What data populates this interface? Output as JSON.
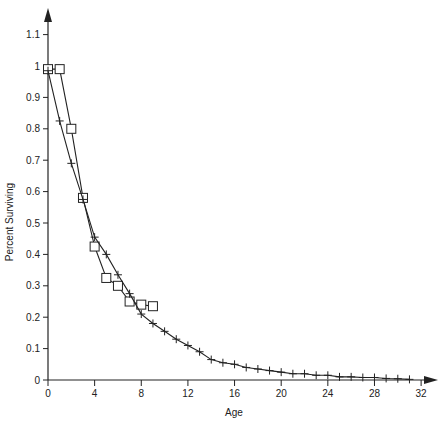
{
  "chart_data": {
    "type": "line",
    "title": "",
    "xlabel": "Age",
    "ylabel": "Percent Surviving",
    "xlim": [
      0,
      33
    ],
    "ylim": [
      0,
      1.15
    ],
    "grid": false,
    "legend": null,
    "x_ticks": [
      0,
      4,
      8,
      12,
      16,
      20,
      24,
      28,
      32
    ],
    "x_tick_labels": [
      "0",
      "4",
      "8",
      "12",
      "16",
      "20",
      "24",
      "28",
      "32"
    ],
    "y_ticks": [
      0,
      0.1,
      0.2,
      0.3,
      0.4,
      0.5,
      0.6,
      0.7,
      0.8,
      0.9,
      1,
      1.1
    ],
    "y_tick_labels": [
      "0",
      "0.1",
      "0.2",
      "0.3",
      "0.4",
      "0.5",
      "0.6",
      "0.7",
      "0.8",
      "0.9",
      "1",
      "1.1"
    ],
    "series": [
      {
        "name": "squares",
        "marker": "square",
        "x": [
          0,
          1,
          2,
          3,
          4,
          5,
          6,
          7,
          8,
          9
        ],
        "values": [
          0.99,
          0.99,
          0.8,
          0.58,
          0.425,
          0.325,
          0.3,
          0.25,
          0.24,
          0.235
        ]
      },
      {
        "name": "crosses",
        "marker": "plus",
        "x": [
          0,
          1,
          2,
          3,
          4,
          5,
          6,
          7,
          8,
          9,
          10,
          11,
          12,
          13,
          14,
          15,
          16,
          17,
          18,
          19,
          20,
          21,
          22,
          23,
          24,
          25,
          26,
          27,
          28,
          29,
          30,
          31
        ],
        "values": [
          0.985,
          0.825,
          0.69,
          0.575,
          0.455,
          0.4,
          0.335,
          0.275,
          0.21,
          0.18,
          0.155,
          0.13,
          0.11,
          0.09,
          0.065,
          0.055,
          0.05,
          0.04,
          0.035,
          0.03,
          0.025,
          0.02,
          0.02,
          0.015,
          0.015,
          0.01,
          0.01,
          0.008,
          0.008,
          0.005,
          0.004,
          0.002
        ]
      }
    ]
  }
}
